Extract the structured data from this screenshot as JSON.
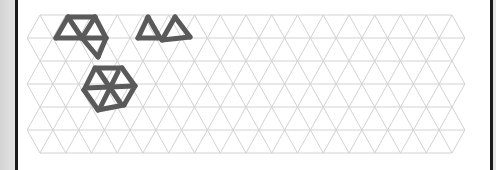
{
  "page": {
    "background_color": "#d9d9d9",
    "sheet_color": "#ffffff",
    "border_color": "#1a1a1a"
  },
  "grid": {
    "type": "isometric-triangle",
    "line_color": "#d2d2d2",
    "rows": 6,
    "columns": 16,
    "spacing_x": 25.75,
    "spacing_y": 23,
    "origin_x": 40,
    "origin_y": 15
  },
  "drawings": {
    "stroke_color": "#5a5a5a",
    "stroke_width": 5,
    "shapes": [
      {
        "name": "triangle-cluster",
        "segments": [
          [
            [
              68,
              17
            ],
            [
              95,
              17
            ]
          ],
          [
            [
              68,
              17
            ],
            [
              56,
              38
            ]
          ],
          [
            [
              68,
              17
            ],
            [
              82,
              38
            ]
          ],
          [
            [
              56,
              38
            ],
            [
              106,
              38
            ]
          ],
          [
            [
              95,
              17
            ],
            [
              82,
              38
            ]
          ],
          [
            [
              95,
              17
            ],
            [
              106,
              38
            ]
          ],
          [
            [
              82,
              38
            ],
            [
              98,
              57
            ]
          ],
          [
            [
              106,
              38
            ],
            [
              98,
              57
            ]
          ]
        ]
      },
      {
        "name": "two-triangles",
        "segments": [
          [
            [
              148,
              17
            ],
            [
              138,
              38
            ]
          ],
          [
            [
              148,
              17
            ],
            [
              160,
              38
            ]
          ],
          [
            [
              138,
              38
            ],
            [
              160,
              38
            ]
          ],
          [
            [
              175,
              17
            ],
            [
              162,
              40
            ]
          ],
          [
            [
              175,
              17
            ],
            [
              190,
              37
            ]
          ],
          [
            [
              162,
              40
            ],
            [
              190,
              37
            ]
          ]
        ]
      },
      {
        "name": "hexagon-with-spokes",
        "segments": [
          [
            [
              95,
              68
            ],
            [
              122,
              68
            ]
          ],
          [
            [
              122,
              68
            ],
            [
              135,
              86
            ]
          ],
          [
            [
              135,
              86
            ],
            [
              124,
              105
            ]
          ],
          [
            [
              124,
              105
            ],
            [
              98,
              110
            ]
          ],
          [
            [
              98,
              110
            ],
            [
              84,
              90
            ]
          ],
          [
            [
              84,
              90
            ],
            [
              95,
              68
            ]
          ],
          [
            [
              86,
              88
            ],
            [
              134,
              86
            ]
          ],
          [
            [
              98,
              70
            ],
            [
              121,
              104
            ]
          ],
          [
            [
              118,
              72
            ],
            [
              100,
              108
            ]
          ]
        ]
      }
    ]
  }
}
